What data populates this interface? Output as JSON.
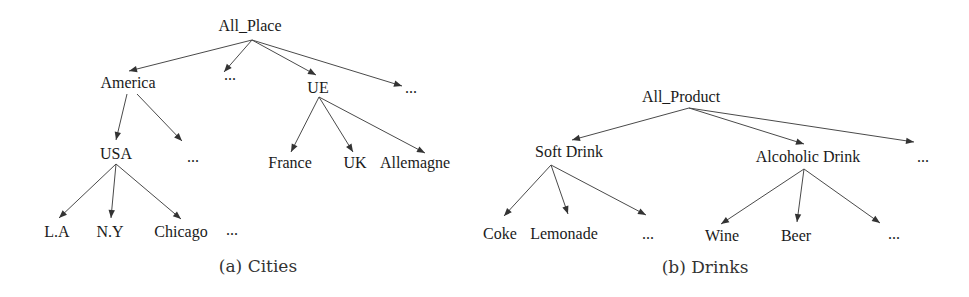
{
  "colors": {
    "text": "#1a1a1a",
    "edge": "#4a4a4a",
    "caption": "#333333",
    "background": "#ffffff"
  },
  "figures": [
    {
      "id": "cities",
      "caption": "(a) Cities",
      "caption_pos": [
        258,
        272
      ],
      "nodes": [
        {
          "id": "all_place",
          "label": "All_Place",
          "x": 250,
          "y": 31
        },
        {
          "id": "america",
          "label": "America",
          "x": 128,
          "y": 88
        },
        {
          "id": "dots1",
          "label": "...",
          "x": 230,
          "y": 80
        },
        {
          "id": "ue",
          "label": "UE",
          "x": 318,
          "y": 93
        },
        {
          "id": "dots2",
          "label": "...",
          "x": 411,
          "y": 93
        },
        {
          "id": "usa",
          "label": "USA",
          "x": 116,
          "y": 159
        },
        {
          "id": "dots3",
          "label": "...",
          "x": 193,
          "y": 162
        },
        {
          "id": "france",
          "label": "France",
          "x": 290,
          "y": 168
        },
        {
          "id": "uk",
          "label": "UK",
          "x": 355,
          "y": 168
        },
        {
          "id": "allemagne",
          "label": "Allemagne",
          "x": 415,
          "y": 168
        },
        {
          "id": "la",
          "label": "L.A",
          "x": 57,
          "y": 237
        },
        {
          "id": "ny",
          "label": "N.Y",
          "x": 110,
          "y": 237
        },
        {
          "id": "chicago",
          "label": "Chicago",
          "x": 181,
          "y": 237
        },
        {
          "id": "dots4",
          "label": "...",
          "x": 232,
          "y": 235
        }
      ],
      "edges": [
        {
          "from": [
            252,
            40
          ],
          "to": [
            129,
            71
          ]
        },
        {
          "from": [
            252,
            40
          ],
          "to": [
            224,
            72
          ]
        },
        {
          "from": [
            252,
            40
          ],
          "to": [
            316,
            75
          ]
        },
        {
          "from": [
            252,
            40
          ],
          "to": [
            402,
            86
          ]
        },
        {
          "from": [
            127,
            94
          ],
          "to": [
            116,
            140
          ]
        },
        {
          "from": [
            137,
            94
          ],
          "to": [
            182,
            141
          ]
        },
        {
          "from": [
            319,
            97
          ],
          "to": [
            291,
            152
          ]
        },
        {
          "from": [
            319,
            97
          ],
          "to": [
            353,
            152
          ]
        },
        {
          "from": [
            319,
            97
          ],
          "to": [
            425,
            153
          ]
        },
        {
          "from": [
            116,
            164
          ],
          "to": [
            59,
            218
          ]
        },
        {
          "from": [
            116,
            164
          ],
          "to": [
            111,
            218
          ]
        },
        {
          "from": [
            116,
            164
          ],
          "to": [
            181,
            219
          ]
        }
      ]
    },
    {
      "id": "drinks",
      "caption": "(b) Drinks",
      "caption_pos": [
        705,
        273
      ],
      "nodes": [
        {
          "id": "all_product",
          "label": "All_Product",
          "x": 681,
          "y": 102
        },
        {
          "id": "soft_drink",
          "label": "Soft Drink",
          "x": 569,
          "y": 157
        },
        {
          "id": "alcoholic_drink",
          "label": "Alcoholic Drink",
          "x": 808,
          "y": 162
        },
        {
          "id": "dots5",
          "label": "...",
          "x": 923,
          "y": 162
        },
        {
          "id": "coke",
          "label": "Coke",
          "x": 500,
          "y": 239
        },
        {
          "id": "lemonade",
          "label": "Lemonade",
          "x": 564,
          "y": 239
        },
        {
          "id": "dots6",
          "label": "...",
          "x": 648,
          "y": 239
        },
        {
          "id": "wine",
          "label": "Wine",
          "x": 722,
          "y": 241
        },
        {
          "id": "beer",
          "label": "Beer",
          "x": 796,
          "y": 241
        },
        {
          "id": "dots7",
          "label": "...",
          "x": 894,
          "y": 239
        }
      ],
      "edges": [
        {
          "from": [
            689,
            108
          ],
          "to": [
            572,
            140
          ]
        },
        {
          "from": [
            689,
            108
          ],
          "to": [
            804,
            144
          ]
        },
        {
          "from": [
            689,
            108
          ],
          "to": [
            914,
            142
          ]
        },
        {
          "from": [
            551,
            165
          ],
          "to": [
            504,
            216
          ]
        },
        {
          "from": [
            551,
            165
          ],
          "to": [
            568,
            214
          ]
        },
        {
          "from": [
            551,
            165
          ],
          "to": [
            646,
            215
          ]
        },
        {
          "from": [
            804,
            169
          ],
          "to": [
            721,
            224
          ]
        },
        {
          "from": [
            804,
            169
          ],
          "to": [
            797,
            222
          ]
        },
        {
          "from": [
            804,
            169
          ],
          "to": [
            880,
            223
          ]
        }
      ]
    }
  ]
}
